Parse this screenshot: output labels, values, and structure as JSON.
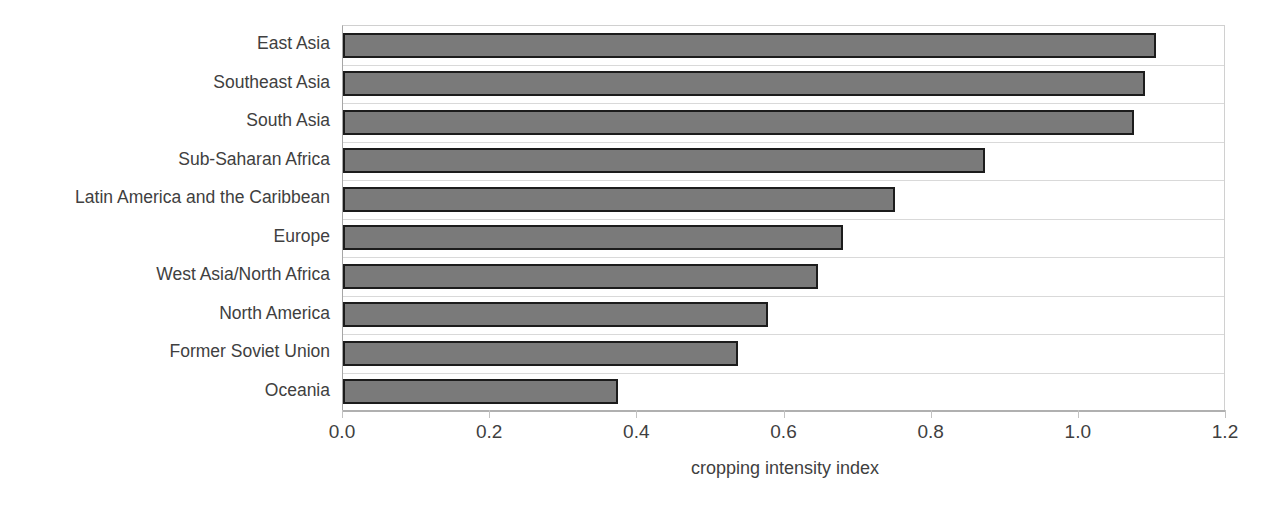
{
  "chart_data": {
    "type": "bar",
    "orientation": "horizontal",
    "title": "",
    "xlabel": "cropping intensity index",
    "ylabel": "",
    "xlim": [
      0.0,
      1.2
    ],
    "xticks": [
      "0.0",
      "0.2",
      "0.4",
      "0.6",
      "0.8",
      "1.0",
      "1.2"
    ],
    "xtick_values": [
      0.0,
      0.2,
      0.4,
      0.6,
      0.8,
      1.0,
      1.2
    ],
    "grid": "horizontal-category-bands",
    "legend": "none",
    "categories": [
      "East Asia",
      "Southeast Asia",
      "South Asia",
      "Sub-Saharan Africa",
      "Latin America and the Caribbean",
      "Europe",
      "West Asia/North Africa",
      "North America",
      "Former Soviet Union",
      "Oceania"
    ],
    "values": [
      1.105,
      1.09,
      1.075,
      0.873,
      0.75,
      0.68,
      0.645,
      0.577,
      0.537,
      0.374
    ],
    "series": [
      {
        "name": "cropping intensity index",
        "values": [
          1.105,
          1.09,
          1.075,
          0.873,
          0.75,
          0.68,
          0.645,
          0.577,
          0.537,
          0.374
        ]
      }
    ],
    "colors": {
      "bar_fill": "#7a7a7a",
      "bar_border": "#1c1c1c",
      "gridline": "#d9d9d9",
      "axis_line": "#b0b0b0",
      "text": "#3f3f3f",
      "background": "#ffffff"
    }
  }
}
